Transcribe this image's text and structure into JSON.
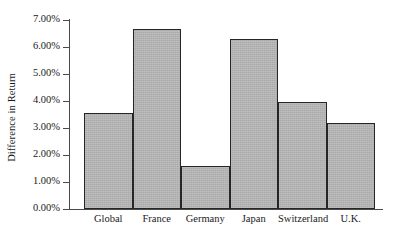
{
  "chart_data": {
    "type": "bar",
    "title": "",
    "xlabel": "",
    "ylabel": "Difference in Return",
    "categories": [
      "Global",
      "France",
      "Germany",
      "Japan",
      "Switzerland",
      "U.K."
    ],
    "values": [
      3.55,
      6.65,
      1.6,
      6.3,
      3.95,
      3.2
    ],
    "value_unit": "%",
    "ylim": [
      0,
      7
    ],
    "ytick_values": [
      0,
      1,
      2,
      3,
      4,
      5,
      6,
      7
    ],
    "ytick_labels": [
      "0.00%",
      "1.00%",
      "2.00%",
      "3.00%",
      "4.00%",
      "5.00%",
      "6.00%",
      "7.00%"
    ],
    "grid": false,
    "legend": null,
    "legend_position": "none",
    "bar_fill_color": "#b2b2b2",
    "bar_edge_color": "#262626",
    "axis_color": "#4a4a4a",
    "background_color": "#ffffff",
    "bar_gap": 0
  },
  "axis": {
    "y_title": "Difference in Return"
  },
  "ticks": [
    {
      "label": "7.00%",
      "value": 7
    },
    {
      "label": "6.00%",
      "value": 6
    },
    {
      "label": "5.00%",
      "value": 5
    },
    {
      "label": "4.00%",
      "value": 4
    },
    {
      "label": "3.00%",
      "value": 3
    },
    {
      "label": "2.00%",
      "value": 2
    },
    {
      "label": "1.00%",
      "value": 1
    },
    {
      "label": "0.00%",
      "value": 0
    }
  ],
  "bars": [
    {
      "label": "Global",
      "value": 3.55,
      "value_label": "3.55%"
    },
    {
      "label": "France",
      "value": 6.65,
      "value_label": "6.65%"
    },
    {
      "label": "Germany",
      "value": 1.6,
      "value_label": "1.60%"
    },
    {
      "label": "Japan",
      "value": 6.3,
      "value_label": "6.30%"
    },
    {
      "label": "Switzerland",
      "value": 3.95,
      "value_label": "3.95%"
    },
    {
      "label": "U.K.",
      "value": 3.2,
      "value_label": "3.20%"
    }
  ]
}
